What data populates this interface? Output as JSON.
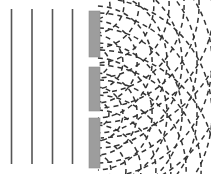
{
  "figure": {
    "width": 211,
    "height": 174,
    "background_color": "#ffffff"
  },
  "colors": {
    "plane_wave_line": "#555555",
    "barrier_fill": "#9d9d9d",
    "barrier_edge": "#8e8e8e",
    "wavefront_dash": "#333333"
  },
  "incident_plane_waves": {
    "label": "incoming plane wavefronts",
    "count": 4,
    "stroke_width": 1.6,
    "y_top": 9,
    "y_bottom": 164,
    "x_positions": [
      11.5,
      32.0,
      52.5,
      72.5
    ]
  },
  "barrier": {
    "label": "triple-slit barrier",
    "x_left": 89,
    "width": 11,
    "segments": [
      {
        "name": "barrier-segment-top",
        "y_top": 11,
        "y_bottom": 57
      },
      {
        "name": "barrier-segment-middle",
        "y_top": 67,
        "y_bottom": 111
      },
      {
        "name": "barrier-segment-bottom",
        "y_top": 118,
        "y_bottom": 168
      }
    ]
  },
  "slits": {
    "label": "slit openings",
    "count": 3,
    "x_center": 95,
    "openings": [
      {
        "name": "slit-top",
        "y_top": 57,
        "y_bottom": 67,
        "y_center": 62
      },
      {
        "name": "slit-middle",
        "y_top": 111,
        "y_bottom": 118,
        "y_center": 114.5
      },
      {
        "name": "slit-bottom-edge",
        "y_top": 168,
        "y_bottom": 174,
        "y_center": 171
      }
    ]
  },
  "diffracted_wavefronts": {
    "label": "circular diffracted wavefronts",
    "style": "dashed",
    "dash_pattern": "5 4",
    "stroke_width": 1.5,
    "angle_start_deg": -88,
    "angle_end_deg": 88,
    "sources": [
      {
        "name": "wavefront-source-top",
        "origin_x": 96,
        "origin_y": 5,
        "radii": [
          14,
          28,
          43,
          58,
          73,
          88,
          103,
          118,
          133
        ]
      },
      {
        "name": "wavefront-source-middle",
        "origin_x": 96,
        "origin_y": 62,
        "radii": [
          13,
          27,
          41,
          56,
          71,
          86,
          101,
          116,
          131
        ]
      },
      {
        "name": "wavefront-source-lower",
        "origin_x": 96,
        "origin_y": 114,
        "radii": [
          13,
          27,
          41,
          56,
          71,
          86,
          101,
          116
        ]
      },
      {
        "name": "wavefront-source-bottom",
        "origin_x": 96,
        "origin_y": 170,
        "radii": [
          15,
          30,
          45,
          60,
          75,
          90,
          105,
          120
        ]
      }
    ]
  }
}
